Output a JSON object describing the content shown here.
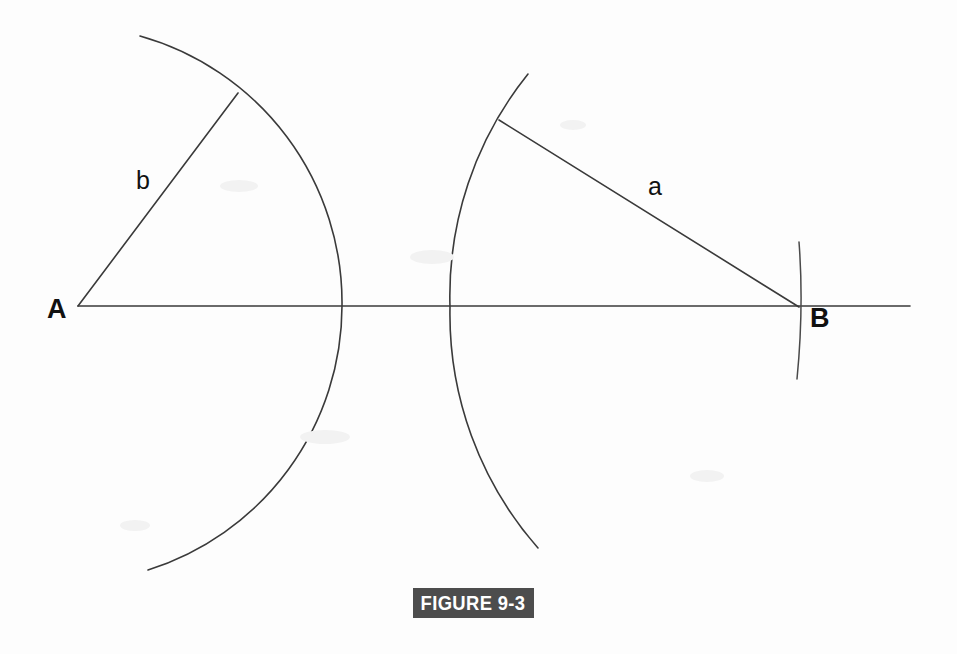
{
  "figure": {
    "caption": "FIGURE 9-3",
    "caption_bg_color": "#4d4d4d",
    "caption_text_color": "#ffffff",
    "background_color": "#fdfdfd",
    "stroke_color": "#3a3a3a"
  },
  "labels": {
    "vertex_a": "A",
    "vertex_b": "B",
    "side_b": "b",
    "side_a": "a"
  },
  "geometry": {
    "baseline": {
      "x1": 78,
      "y1": 306,
      "x2": 910,
      "y2": 306
    },
    "point_a": {
      "x": 78,
      "y": 306
    },
    "point_b": {
      "x": 799,
      "y": 307
    },
    "side_b_line": {
      "x1": 78,
      "y1": 306,
      "x2": 238,
      "y2": 93
    },
    "side_a_line": {
      "x1": 499,
      "y1": 120,
      "x2": 799,
      "y2": 307
    },
    "arc_from_a": {
      "cx": 78,
      "cy": 306,
      "r": 264,
      "start": {
        "x": 140,
        "y": 36
      },
      "end": {
        "x": 148,
        "y": 570
      }
    },
    "arc_from_b": {
      "cx": 799,
      "cy": 307,
      "r": 350,
      "start": {
        "x": 528,
        "y": 74
      },
      "end": {
        "x": 538,
        "y": 548
      }
    },
    "arc_at_b": {
      "start": {
        "x": 799,
        "y": 242
      },
      "end": {
        "x": 797,
        "y": 379
      }
    },
    "label_positions": {
      "vertex_a": {
        "x": 47,
        "y": 318
      },
      "vertex_b": {
        "x": 810,
        "y": 327
      },
      "side_b": {
        "x": 136,
        "y": 189
      },
      "side_a": {
        "x": 648,
        "y": 195
      }
    }
  }
}
